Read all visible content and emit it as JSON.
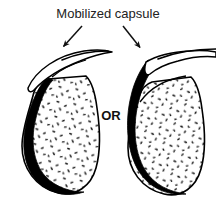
{
  "figure": {
    "title_label": "Mobilized capsule",
    "connector_label": "OR",
    "background_color": "#ffffff",
    "ink_color": "#000000",
    "text_color": "#222222",
    "stipple_color": "#1a1a1a",
    "annotations": [
      {
        "name": "arrow-left",
        "points_to": "left-capsule-flap"
      },
      {
        "name": "arrow-right",
        "points_to": "right-capsule-flap"
      }
    ],
    "variants": [
      {
        "id": "left",
        "name": "organ-left",
        "description": "Pear-shaped organ with thick black capsule along left margin and capsule flap peeled upward-left",
        "flap_direction": "left"
      },
      {
        "id": "right",
        "name": "organ-right",
        "description": "Pear-shaped organ with thick black capsule along left margin continuing up and over, flap peeled upward-right",
        "flap_direction": "right"
      }
    ]
  }
}
